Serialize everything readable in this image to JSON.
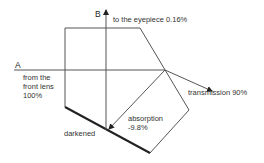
{
  "diagram": {
    "labels": {
      "beam_a": "A",
      "beam_b": "B",
      "eyepiece": "to the eyepiece 0.16%",
      "front_lens_line1": "from the",
      "front_lens_line2": "front lens",
      "front_lens_line3": "100%",
      "transmission": "transmission 90%",
      "absorption_line1": "absorption",
      "absorption_line2": "-9.8%",
      "darkened": "darkened"
    },
    "values": {
      "input_percent": "100%",
      "eyepiece_percent": "0.16%",
      "transmission_percent": "90%",
      "absorption_percent": "-9.8%"
    },
    "colors": {
      "line": "#555555",
      "thick_edge": "#222222",
      "text": "#333333"
    }
  }
}
